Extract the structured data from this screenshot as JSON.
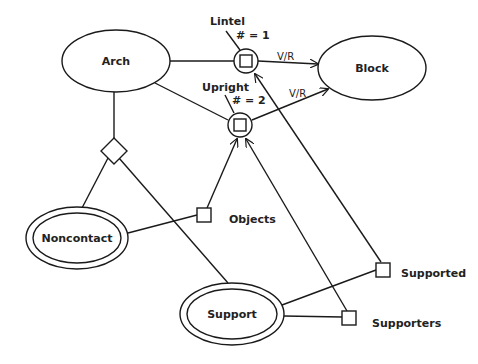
{
  "diagram": {
    "nodes": {
      "arch": {
        "label": "Arch",
        "shape": "ellipse"
      },
      "block": {
        "label": "Block",
        "shape": "ellipse"
      },
      "noncontact": {
        "label": "Noncontact",
        "shape": "double-ellipse"
      },
      "support": {
        "label": "Support",
        "shape": "double-ellipse"
      },
      "lintel": {
        "label": "Lintel",
        "count": "# = 1",
        "shape": "circle-with-square"
      },
      "upright": {
        "label": "Upright",
        "count": "# = 2",
        "shape": "circle-with-square"
      },
      "objects": {
        "label": "Objects",
        "shape": "square"
      },
      "supported": {
        "label": "Supported",
        "shape": "square"
      },
      "supporters": {
        "label": "Supporters",
        "shape": "square"
      },
      "diamond": {
        "shape": "diamond"
      }
    },
    "edges": {
      "lintel_block": {
        "label": "V/R"
      },
      "upright_block": {
        "label": "V/R"
      }
    },
    "colors": {
      "stroke": "#1a1a1a",
      "background": "#ffffff",
      "text": "#222222"
    }
  }
}
